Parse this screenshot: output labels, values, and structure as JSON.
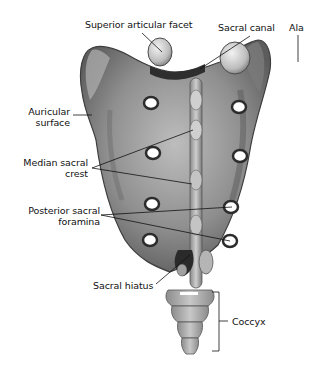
{
  "figure": {
    "labels": {
      "superior_articular_facet": "Superior articular facet",
      "sacral_canal": "Sacral canal",
      "ala": "Ala",
      "auricular_surface_1": "Auricular",
      "auricular_surface_2": "surface",
      "median_sacral_crest_1": "Median sacral",
      "median_sacral_crest_2": "crest",
      "posterior_sacral_foramina_1": "Posterior sacral",
      "posterior_sacral_foramina_2": "foramina",
      "sacral_hiatus": "Sacral hiatus",
      "coccyx": "Coccyx"
    },
    "colors": {
      "background": "#ffffff",
      "bone_light": "#c9c9c9",
      "bone_mid": "#8e8e8e",
      "bone_dark": "#4a4a4a",
      "foramen": "#ffffff",
      "leader_line": "#111111"
    }
  }
}
